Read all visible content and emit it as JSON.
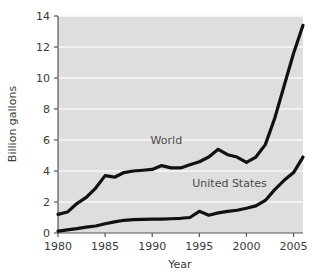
{
  "chart_data": {
    "type": "line",
    "title": "",
    "xlabel": "Year",
    "ylabel": "Billion gallons",
    "xlim": [
      1980,
      2006
    ],
    "ylim": [
      0,
      14
    ],
    "grid": "horizontal",
    "legend": "inline-annotations",
    "x_ticks": [
      "1980",
      "1985",
      "1990",
      "1995",
      "2000",
      "2005"
    ],
    "x_tick_values": [
      1980,
      1985,
      1990,
      1995,
      2000,
      2005
    ],
    "y_ticks": [
      "0",
      "2",
      "4",
      "6",
      "8",
      "10",
      "12",
      "14"
    ],
    "y_tick_values": [
      0,
      2,
      4,
      6,
      8,
      10,
      12,
      14
    ],
    "x": [
      1980,
      1981,
      1982,
      1983,
      1984,
      1985,
      1986,
      1987,
      1988,
      1989,
      1990,
      1991,
      1992,
      1993,
      1994,
      1995,
      1996,
      1997,
      1998,
      1999,
      2000,
      2001,
      2002,
      2003,
      2004,
      2005,
      2006
    ],
    "series": [
      {
        "name": "World",
        "color": "#111111",
        "values": [
          1.2,
          1.35,
          1.9,
          2.3,
          2.9,
          3.7,
          3.6,
          3.9,
          4.0,
          4.05,
          4.1,
          4.35,
          4.2,
          4.2,
          4.4,
          4.6,
          4.9,
          5.4,
          5.05,
          4.9,
          4.55,
          4.9,
          5.7,
          7.4,
          9.5,
          11.6,
          13.4
        ],
        "annotation": {
          "text": "World",
          "x": 1991.5,
          "y": 5.75
        }
      },
      {
        "name": "United States",
        "color": "#111111",
        "values": [
          0.12,
          0.2,
          0.28,
          0.38,
          0.45,
          0.6,
          0.72,
          0.82,
          0.86,
          0.88,
          0.9,
          0.9,
          0.92,
          0.95,
          1.0,
          1.4,
          1.15,
          1.3,
          1.4,
          1.47,
          1.6,
          1.75,
          2.1,
          2.8,
          3.4,
          3.9,
          4.9
        ],
        "annotation": {
          "text": "United States",
          "x": 1998.2,
          "y": 3.0
        }
      }
    ],
    "colors": {
      "plot_background": "#dedede",
      "gridline": "#f7f7f7",
      "axis": "#555555",
      "line": "#111111",
      "text": "#3a3a3a"
    }
  }
}
